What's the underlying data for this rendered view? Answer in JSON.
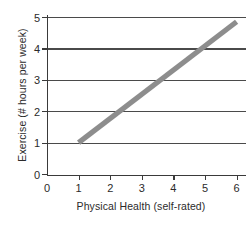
{
  "chart_data": {
    "type": "line",
    "title": "",
    "xlabel": "Physical Health (self-rated)",
    "ylabel": "Exercise (# hours per week)",
    "xlim": [
      0,
      6.3
    ],
    "ylim": [
      0,
      5.15
    ],
    "grid": "horizontal",
    "legend": "none",
    "x_ticks": [
      "0",
      "1",
      "2",
      "3",
      "4",
      "5",
      "6"
    ],
    "x_tick_values": [
      0,
      1,
      2,
      3,
      4,
      5,
      6
    ],
    "y_ticks": [
      "0",
      "1",
      "2",
      "3",
      "4",
      "5"
    ],
    "y_tick_values": [
      0,
      1,
      2,
      3,
      4,
      5
    ],
    "series": [
      {
        "name": "Exercise vs Physical Health trend",
        "style": "solid-thick-line",
        "color": "#8d8d8d",
        "x": [
          1,
          6
        ],
        "values": [
          1,
          4.85
        ]
      }
    ],
    "annotations": []
  },
  "axes": {
    "y_title": "Exercise (# hours per week)",
    "x_title": "Physical Health (self-rated)",
    "y_tick_labels": [
      "5",
      "4",
      "3",
      "2",
      "1",
      "0"
    ],
    "x_tick_labels": [
      "0",
      "1",
      "2",
      "3",
      "4",
      "5",
      "6"
    ]
  },
  "colors": {
    "line": "#8d8d8d",
    "grid": "#4a4a4a",
    "axis": "#3a3a3a",
    "text": "#2b2b2b",
    "background": "#ffffff"
  }
}
